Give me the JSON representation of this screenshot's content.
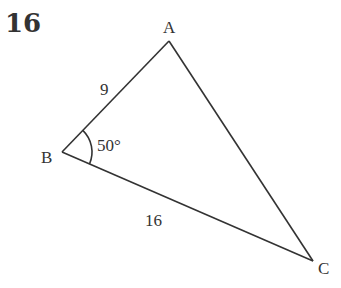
{
  "question_number": "16",
  "diagram": {
    "vertices": {
      "A": {
        "label": "A",
        "x": 169,
        "y": 41
      },
      "B": {
        "label": "B",
        "x": 62,
        "y": 152
      },
      "C": {
        "label": "C",
        "x": 313,
        "y": 261
      }
    },
    "side_AB": "9",
    "side_BC": "16",
    "angle_B": "50°"
  }
}
